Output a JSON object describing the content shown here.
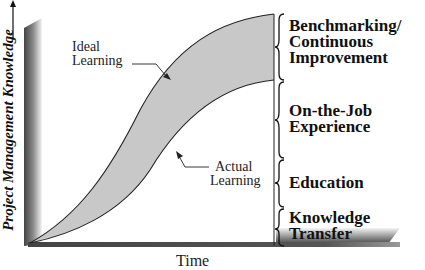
{
  "diagram": {
    "y_axis_label": "Project Management Knowledge",
    "x_axis_label": "Time",
    "curves": [
      {
        "name": "ideal",
        "label_line1": "Ideal",
        "label_line2": "Learning"
      },
      {
        "name": "actual",
        "label_line1": "Actual",
        "label_line2": "Learning"
      }
    ],
    "stages": [
      {
        "line1": "Benchmarking/",
        "line2": "Continuous",
        "line3": "Improvement"
      },
      {
        "line1": "On-the-Job",
        "line2": "Experience"
      },
      {
        "line1": "Education"
      },
      {
        "line1": "Knowledge",
        "line2": "Transfer"
      }
    ],
    "colors": {
      "gap_fill": "#c8c8c8",
      "axis_dark": "#333333",
      "line": "#222222"
    }
  }
}
